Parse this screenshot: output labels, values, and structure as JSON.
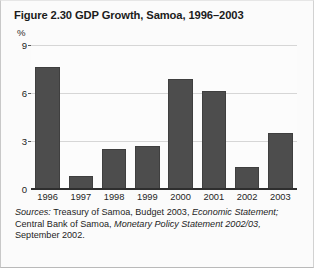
{
  "figure": {
    "title": "Figure 2.30  GDP Growth, Samoa, 1996–2003",
    "unit_label": "%",
    "source_parts": {
      "label": "Sources:",
      "line1_a": "Treasury of Samoa,  Budget 2003,",
      "line1_b": "Economic Statement;",
      "line2_a": "Central Bank of Samoa,",
      "line2_b": "Monetary Policy Statement 2002/03,",
      "line3": "September 2002."
    }
  },
  "colors": {
    "bar": "#4d4d4d",
    "bar_edge": "#3f3f3f",
    "gridline": "#d6d6d6",
    "axis": "#2e2e2e",
    "page_background": "#fbfbfb",
    "plot_background": "#fcfcfc",
    "text": "#1d1d1d"
  },
  "chart_data": {
    "type": "bar",
    "title": "Figure 2.30  GDP Growth, Samoa, 1996–2003",
    "subtitle": "",
    "xlabel": "",
    "ylabel": "%",
    "categories": [
      "1996",
      "1997",
      "1998",
      "1999",
      "2000",
      "2001",
      "2002",
      "2003"
    ],
    "values": [
      7.6,
      0.8,
      2.5,
      2.7,
      6.9,
      6.1,
      1.4,
      3.5
    ],
    "ylim": [
      0,
      9
    ],
    "yticks": [
      0,
      3,
      6,
      9
    ],
    "ytick_labels": [
      "0",
      "3",
      "6",
      "9"
    ],
    "grid": true,
    "grid_axis": "y",
    "legend": false,
    "legend_position": "none",
    "series": [
      {
        "name": "GDP Growth",
        "values": [
          7.6,
          0.8,
          2.5,
          2.7,
          6.9,
          6.1,
          1.4,
          3.5
        ]
      }
    ],
    "annotations": []
  }
}
